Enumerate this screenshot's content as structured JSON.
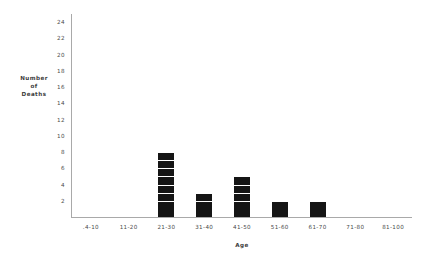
{
  "chart_data": {
    "type": "bar",
    "title": "",
    "xlabel": "Age",
    "ylabel": "Number of Deaths",
    "ylabel_lines": [
      "Number",
      "of",
      "Deaths"
    ],
    "categories": [
      ".4-10",
      "11-20",
      "21-30",
      "31-40",
      "41-50",
      "51-60",
      "61-70",
      "71-80",
      "81-100"
    ],
    "values": [
      0,
      0,
      8,
      3,
      5,
      2,
      2,
      0,
      0
    ],
    "ylim": [
      0,
      25
    ],
    "ytick_labels": [
      "24",
      "22",
      "20",
      "18",
      "16",
      "14",
      "12",
      "10",
      "8",
      "6",
      "4",
      "2"
    ],
    "ytick_values": [
      24,
      22,
      20,
      18,
      16,
      14,
      12,
      10,
      8,
      6,
      4,
      2
    ],
    "grid": false,
    "legend": false,
    "bar_style": "stacked-unit-blocks",
    "bar_color": "#151515",
    "axis_color": "#a9a9a9",
    "text_color": "#4a4a4a",
    "background": "#ffffff"
  }
}
